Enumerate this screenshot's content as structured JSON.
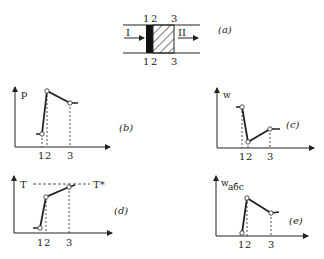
{
  "panel_a": {
    "label": "(a)",
    "top_marks": [
      "1",
      "2",
      "3"
    ],
    "bottom_marks": [
      "1",
      "2",
      "3"
    ],
    "left_region": "I",
    "right_region": "II"
  },
  "panel_b": {
    "label": "(b)",
    "y_axis": "p",
    "x_ticks": [
      "1",
      "2",
      "3"
    ]
  },
  "panel_c": {
    "label": "(c)",
    "y_axis": "w",
    "x_ticks": [
      "1",
      "2",
      "3"
    ]
  },
  "panel_d": {
    "label": "(d)",
    "y_axis": "T",
    "reference_line": "T*",
    "x_ticks": [
      "1",
      "2",
      "3"
    ]
  },
  "panel_e": {
    "label": "(e)",
    "y_axis": "w",
    "y_axis_sub": "абс",
    "x_ticks": [
      "1",
      "2",
      "3"
    ]
  }
}
